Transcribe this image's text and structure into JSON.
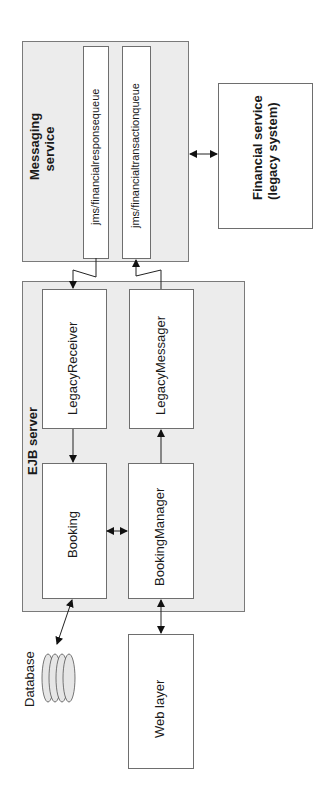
{
  "diagram": {
    "orientation": "rotated -90deg",
    "containers": {
      "messaging_service": {
        "label_line1": "Messaging",
        "label_line2": "service"
      },
      "ejb_server": {
        "label": "EJB server"
      }
    },
    "queues": [
      {
        "label": "jms/financialresponsequeue"
      },
      {
        "label": "jms/financialtransactionqueue"
      }
    ],
    "components": {
      "legacy_receiver": "LegacyReceiver",
      "legacy_messager": "LegacyMessager",
      "booking": "Booking",
      "booking_manager": "BookingManager",
      "web_layer": "Web layer",
      "database": "Database",
      "financial_service_line1": "Financial service",
      "financial_service_line2": "(legacy system)"
    },
    "connections": [
      {
        "from": "jms/financialresponsequeue",
        "to": "LegacyReceiver",
        "type": "message"
      },
      {
        "from": "LegacyMessager",
        "to": "jms/financialtransactionqueue",
        "type": "message"
      },
      {
        "from": "LegacyReceiver",
        "to": "Booking",
        "type": "one-way"
      },
      {
        "from": "BookingManager",
        "to": "LegacyMessager",
        "type": "one-way"
      },
      {
        "from": "Booking",
        "to": "BookingManager",
        "type": "bidirectional"
      },
      {
        "from": "Booking",
        "to": "Database",
        "type": "bidirectional"
      },
      {
        "from": "BookingManager",
        "to": "Web layer",
        "type": "bidirectional"
      },
      {
        "from": "Messaging service",
        "to": "Financial service",
        "type": "bidirectional"
      }
    ],
    "colors": {
      "container_fill": "#ececec",
      "box_fill": "#ffffff",
      "stroke": "#6e6e6e",
      "arrow": "#111111"
    }
  }
}
